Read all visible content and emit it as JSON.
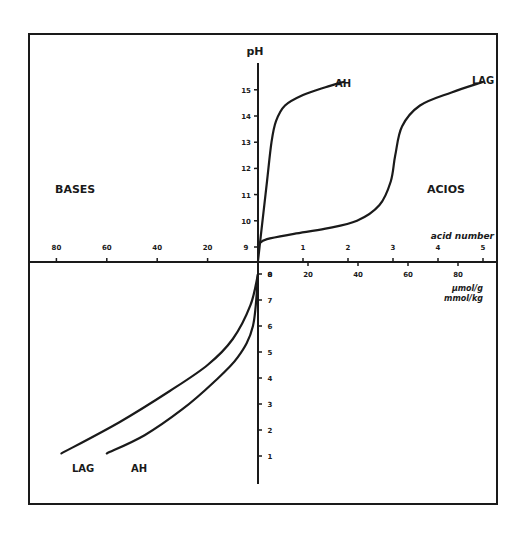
{
  "chart_data": {
    "type": "line",
    "title": "",
    "ylabel": "pH",
    "region_labels": {
      "left": "BASES",
      "right": "ACIOS"
    },
    "x_axis_upper_right": {
      "label": "acid number",
      "ticks": [
        1,
        2,
        3,
        4,
        5
      ]
    },
    "x_axis_lower_right": {
      "label_line1": "μmol/g",
      "label_line2": "mmol/kg",
      "ticks": [
        0,
        20,
        40,
        60,
        80
      ]
    },
    "x_axis_left": {
      "ticks": [
        80,
        60,
        40,
        20
      ]
    },
    "y_axis_upper_ticks": [
      9,
      10,
      11,
      12,
      13,
      14,
      15
    ],
    "y_axis_lower_ticks": [
      8,
      7,
      6,
      5,
      4,
      3,
      2,
      1
    ],
    "series": [
      {
        "name": "AH",
        "region": "acids",
        "x_acid_number": [
          0.0,
          0.1,
          0.2,
          0.3,
          0.4,
          0.6,
          1.0,
          1.5,
          1.9
        ],
        "ph": [
          8.5,
          10.0,
          11.5,
          13.0,
          13.8,
          14.4,
          14.8,
          15.1,
          15.3
        ]
      },
      {
        "name": "LAG",
        "region": "acids",
        "x_acid_number": [
          0.0,
          0.2,
          0.8,
          1.5,
          2.2,
          2.7,
          2.95,
          3.05,
          3.2,
          3.6,
          4.3,
          5.0
        ],
        "ph": [
          9.1,
          9.3,
          9.5,
          9.7,
          10.0,
          10.6,
          11.5,
          12.5,
          13.6,
          14.4,
          14.9,
          15.3
        ]
      },
      {
        "name": "AH",
        "region": "bases",
        "x_base_umol_g": [
          0,
          2,
          8,
          18,
          30,
          45,
          60
        ],
        "ph": [
          8.0,
          6.0,
          4.8,
          3.8,
          2.8,
          1.8,
          1.1
        ]
      },
      {
        "name": "LAG",
        "region": "bases",
        "x_base_umol_g": [
          0,
          3,
          10,
          20,
          35,
          55,
          78
        ],
        "ph": [
          8.0,
          6.8,
          5.5,
          4.5,
          3.5,
          2.3,
          1.1
        ]
      }
    ],
    "legend": [
      "AH",
      "LAG"
    ],
    "grid": false
  }
}
